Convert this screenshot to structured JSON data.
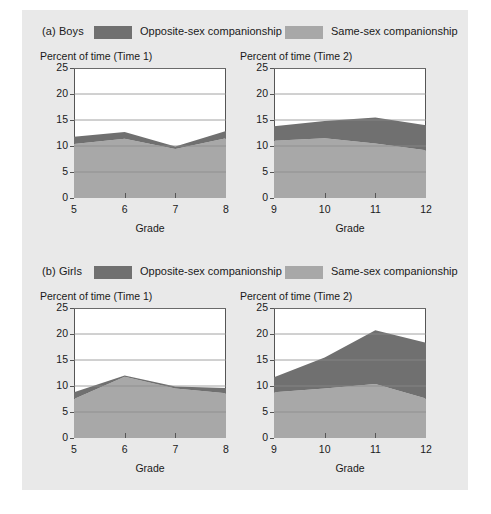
{
  "figure": {
    "background_color": "#e9e9e9",
    "panels": [
      {
        "id": "boys",
        "label": "(a) Boys",
        "legend": [
          {
            "key": "opposite",
            "text": "Opposite-sex companionship",
            "color": "#707070"
          },
          {
            "key": "same",
            "text": "Same-sex companionship",
            "color": "#a8a8a8"
          }
        ],
        "charts": [
          "boys_time1",
          "boys_time2"
        ]
      },
      {
        "id": "girls",
        "label": "(b) Girls",
        "legend": [
          {
            "key": "opposite",
            "text": "Opposite-sex companionship",
            "color": "#707070"
          },
          {
            "key": "same",
            "text": "Same-sex companionship",
            "color": "#a8a8a8"
          }
        ],
        "charts": [
          "girls_time1",
          "girls_time2"
        ]
      }
    ]
  },
  "chart_data": [
    {
      "id": "boys_time1",
      "type": "area",
      "stacked": true,
      "title": "Percent of time (Time 1)",
      "xlabel": "Grade",
      "ylabel": "",
      "categories": [
        5,
        6,
        7,
        8
      ],
      "xticklabels": [
        "5",
        "6",
        "7",
        "8"
      ],
      "yticklabels": [
        "0",
        "5",
        "10",
        "15",
        "20",
        "25"
      ],
      "yticks": [
        0,
        5,
        10,
        15,
        20,
        25
      ],
      "ylim": [
        0,
        25
      ],
      "xlim": [
        5,
        8
      ],
      "grid": true,
      "legend_position": "above-panel",
      "series": [
        {
          "name": "Same-sex companionship",
          "color": "#a8a8a8",
          "values": [
            10.4,
            11.4,
            9.4,
            11.5
          ]
        },
        {
          "name": "Opposite-sex companionship",
          "color": "#707070",
          "values": [
            1.4,
            1.3,
            0.5,
            1.4
          ]
        }
      ],
      "totals": [
        11.8,
        12.7,
        9.9,
        12.9
      ]
    },
    {
      "id": "boys_time2",
      "type": "area",
      "stacked": true,
      "title": "Percent of time (Time 2)",
      "xlabel": "Grade",
      "ylabel": "",
      "categories": [
        9,
        10,
        11,
        12
      ],
      "xticklabels": [
        "9",
        "10",
        "11",
        "12"
      ],
      "yticklabels": [
        "0",
        "5",
        "10",
        "15",
        "20",
        "25"
      ],
      "yticks": [
        0,
        5,
        10,
        15,
        20,
        25
      ],
      "ylim": [
        0,
        25
      ],
      "xlim": [
        9,
        12
      ],
      "grid": true,
      "legend_position": "above-panel",
      "series": [
        {
          "name": "Same-sex companionship",
          "color": "#a8a8a8",
          "values": [
            11.0,
            11.5,
            10.5,
            9.2
          ]
        },
        {
          "name": "Opposite-sex companionship",
          "color": "#707070",
          "values": [
            2.8,
            3.3,
            5.0,
            4.8
          ]
        }
      ],
      "totals": [
        13.8,
        14.8,
        15.5,
        14.0
      ]
    },
    {
      "id": "girls_time1",
      "type": "area",
      "stacked": true,
      "title": "Percent of time (Time 1)",
      "xlabel": "Grade",
      "ylabel": "",
      "categories": [
        5,
        6,
        7,
        8
      ],
      "xticklabels": [
        "5",
        "6",
        "7",
        "8"
      ],
      "yticklabels": [
        "0",
        "5",
        "10",
        "15",
        "20",
        "25"
      ],
      "yticks": [
        0,
        5,
        10,
        15,
        20,
        25
      ],
      "ylim": [
        0,
        25
      ],
      "xlim": [
        5,
        8
      ],
      "grid": true,
      "legend_position": "above-panel",
      "series": [
        {
          "name": "Same-sex companionship",
          "color": "#a8a8a8",
          "values": [
            7.5,
            11.8,
            9.5,
            8.6
          ]
        },
        {
          "name": "Opposite-sex companionship",
          "color": "#707070",
          "values": [
            1.3,
            0.2,
            0.4,
            1.0
          ]
        }
      ],
      "totals": [
        8.8,
        12.0,
        9.9,
        9.6
      ]
    },
    {
      "id": "girls_time2",
      "type": "area",
      "stacked": true,
      "title": "Percent of time (Time 2)",
      "xlabel": "Grade",
      "ylabel": "",
      "categories": [
        9,
        10,
        11,
        12
      ],
      "xticklabels": [
        "9",
        "10",
        "11",
        "12"
      ],
      "yticklabels": [
        "0",
        "5",
        "10",
        "15",
        "20",
        "25"
      ],
      "yticks": [
        0,
        5,
        10,
        15,
        20,
        25
      ],
      "ylim": [
        0,
        25
      ],
      "xlim": [
        9,
        12
      ],
      "grid": true,
      "legend_position": "above-panel",
      "series": [
        {
          "name": "Same-sex companionship",
          "color": "#a8a8a8",
          "values": [
            8.8,
            9.5,
            10.4,
            7.6
          ]
        },
        {
          "name": "Opposite-sex companionship",
          "color": "#707070",
          "values": [
            2.9,
            6.0,
            10.3,
            10.7
          ]
        }
      ],
      "totals": [
        11.7,
        15.5,
        20.7,
        18.3
      ]
    }
  ]
}
